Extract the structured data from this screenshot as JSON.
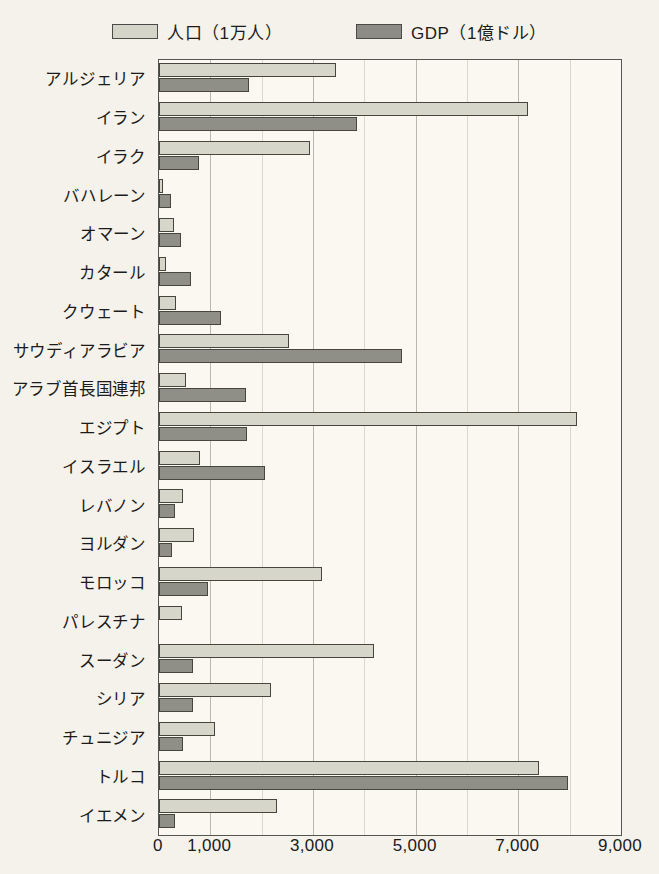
{
  "chart_data": {
    "type": "bar",
    "orientation": "horizontal",
    "title": "",
    "xlabel": "",
    "ylabel": "",
    "xlim": [
      0,
      9000
    ],
    "grid": true,
    "legend_position": "top-center",
    "tick_values": [
      0,
      1000,
      3000,
      5000,
      7000,
      9000
    ],
    "tick_labels": [
      "0",
      "1,000",
      "3,000",
      "5,000",
      "7,000",
      "9,000"
    ],
    "gridline_step": 1000,
    "categories": [
      "アルジェリア",
      "イラン",
      "イラク",
      "バハレーン",
      "オマーン",
      "カタール",
      "クウェート",
      "サウディアラビア",
      "アラブ首長国連邦",
      "エジプト",
      "イスラエル",
      "レバノン",
      "ヨルダン",
      "モロッコ",
      "パレスチナ",
      "スーダン",
      "シリア",
      "チュニジア",
      "トルコ",
      "イエメン"
    ],
    "series": [
      {
        "name": "人口（1万人）",
        "color": "#d7d6ca",
        "values": [
          3450,
          7180,
          2950,
          70,
          290,
          140,
          330,
          2530,
          530,
          8150,
          800,
          470,
          680,
          3170,
          450,
          4180,
          2180,
          1090,
          7400,
          2300
        ]
      },
      {
        "name": "GDP（1億ドル）",
        "color": "#8f8f87",
        "values": [
          1750,
          3850,
          780,
          230,
          430,
          620,
          1200,
          4730,
          1700,
          1720,
          2060,
          310,
          250,
          950,
          0,
          660,
          660,
          470,
          7960,
          310
        ]
      }
    ]
  },
  "legend": {
    "entries": [
      {
        "label": "人口（1万人）",
        "swatch": "light-gray-swatch"
      },
      {
        "label": "GDP（1億ドル）",
        "swatch": "dark-gray-swatch"
      }
    ]
  },
  "colors": {
    "population_bar": "#d7d6ca",
    "gdp_bar": "#8f8f87",
    "bar_outline": "#46463f",
    "frame": "#55554f",
    "gridline": "#b9b8ae",
    "background": "#f4f2ea",
    "plot_background": "#faf8f1"
  }
}
